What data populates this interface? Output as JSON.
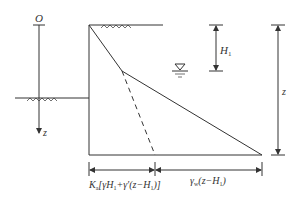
{
  "diagram": {
    "type": "earth-pressure-distribution",
    "labels": {
      "origin": "O",
      "depth_axis": "z",
      "water_depth": "H",
      "water_depth_sub": "1",
      "total_depth": "z",
      "active_pressure_part1": "K",
      "active_pressure_part1_sub": "a",
      "active_pressure_part2": "[γH",
      "active_pressure_part2_sub": "1",
      "active_pressure_part3": "+γ′(z−H",
      "active_pressure_part3_sub": "1",
      "active_pressure_part4": ")]",
      "water_pressure_part1": "γ",
      "water_pressure_part1_sub": "w",
      "water_pressure_part2": "(z−H",
      "water_pressure_part2_sub": "1",
      "water_pressure_part3": ")"
    },
    "symbols": {
      "water_table": "water-table-symbol",
      "ground_hatch": "ground-surface-hatch"
    },
    "colors": {
      "line": "#333333",
      "background": "#ffffff"
    }
  }
}
